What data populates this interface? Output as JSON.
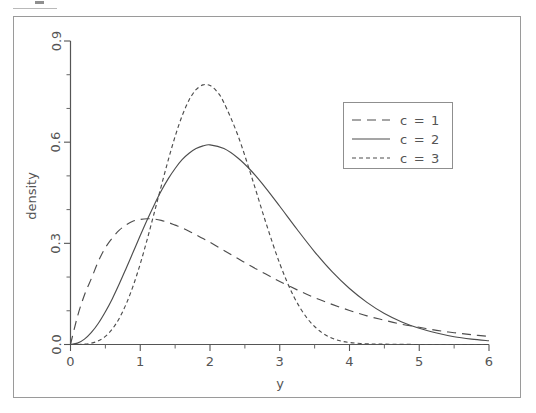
{
  "figure": {
    "frame": {
      "border_color": "#9a9a9a",
      "background": "#ffffff"
    },
    "top_artifact": {
      "visible": true
    }
  },
  "chart_data": {
    "type": "line",
    "title": "",
    "xlabel": "y",
    "ylabel": "density",
    "xlim": [
      0,
      6
    ],
    "ylim": [
      0,
      0.9
    ],
    "grid": false,
    "legend_position": "upper right",
    "x_ticks": [
      "0",
      "1",
      "2",
      "3",
      "4",
      "5",
      "6"
    ],
    "x_tick_values": [
      0,
      1,
      2,
      3,
      4,
      5,
      6
    ],
    "x_minor_tick_values": [
      0.5,
      1.5,
      2.5,
      3.5,
      4.5,
      5.5
    ],
    "y_ticks": [
      "0.0",
      "0.3",
      "0.6",
      "0.9"
    ],
    "y_tick_values": [
      0.0,
      0.3,
      0.6,
      0.9
    ],
    "y_minor_tick_values": [
      0.1,
      0.2,
      0.4,
      0.5,
      0.7,
      0.8
    ],
    "line_color": "#4d4d4d",
    "series": [
      {
        "name": "c = 1",
        "dash": "long-dash",
        "dasharray": "9 6",
        "x": [
          0.0,
          0.1,
          0.2,
          0.3,
          0.4,
          0.5,
          0.6,
          0.7,
          0.8,
          0.9,
          1.0,
          1.1,
          1.2,
          1.3,
          1.4,
          1.5,
          1.6,
          1.7,
          1.8,
          1.9,
          2.0,
          2.2,
          2.4,
          2.6,
          2.8,
          3.0,
          3.25,
          3.5,
          3.75,
          4.0,
          4.25,
          4.5,
          4.75,
          5.0,
          5.25,
          5.5,
          5.75,
          6.0
        ],
        "values": [
          0.0,
          0.083,
          0.147,
          0.196,
          0.247,
          0.287,
          0.316,
          0.339,
          0.355,
          0.366,
          0.371,
          0.373,
          0.372,
          0.368,
          0.362,
          0.354,
          0.346,
          0.336,
          0.325,
          0.314,
          0.303,
          0.279,
          0.255,
          0.231,
          0.209,
          0.187,
          0.162,
          0.139,
          0.119,
          0.101,
          0.085,
          0.072,
          0.06,
          0.051,
          0.042,
          0.035,
          0.029,
          0.024
        ]
      },
      {
        "name": "c = 2",
        "dash": "solid",
        "dasharray": "",
        "x": [
          0.0,
          0.1,
          0.2,
          0.3,
          0.4,
          0.5,
          0.6,
          0.7,
          0.8,
          0.9,
          1.0,
          1.1,
          1.2,
          1.3,
          1.4,
          1.5,
          1.6,
          1.7,
          1.8,
          1.9,
          2.0,
          2.2,
          2.4,
          2.6,
          2.8,
          3.0,
          3.25,
          3.5,
          3.75,
          4.0,
          4.25,
          4.5,
          4.75,
          5.0,
          5.25,
          5.5,
          5.75,
          6.0
        ],
        "values": [
          0.0,
          0.004,
          0.016,
          0.036,
          0.063,
          0.097,
          0.136,
          0.18,
          0.227,
          0.275,
          0.323,
          0.37,
          0.414,
          0.455,
          0.491,
          0.522,
          0.548,
          0.567,
          0.581,
          0.589,
          0.592,
          0.581,
          0.553,
          0.513,
          0.464,
          0.41,
          0.341,
          0.275,
          0.216,
          0.166,
          0.125,
          0.092,
          0.067,
          0.048,
          0.034,
          0.023,
          0.016,
          0.011
        ]
      },
      {
        "name": "c = 3",
        "dash": "short-dash",
        "dasharray": "4 3",
        "x": [
          0.0,
          0.1,
          0.2,
          0.3,
          0.4,
          0.5,
          0.6,
          0.7,
          0.8,
          0.9,
          1.0,
          1.1,
          1.2,
          1.3,
          1.4,
          1.5,
          1.6,
          1.7,
          1.75,
          1.8,
          1.9,
          2.0,
          2.1,
          2.2,
          2.4,
          2.6,
          2.8,
          3.0,
          3.2,
          3.4,
          3.6,
          3.8,
          4.0,
          4.25,
          4.5,
          5.0,
          5.5,
          6.0
        ],
        "values": [
          0.0,
          0.0,
          0.001,
          0.004,
          0.011,
          0.024,
          0.046,
          0.078,
          0.121,
          0.175,
          0.239,
          0.312,
          0.39,
          0.469,
          0.546,
          0.617,
          0.678,
          0.725,
          0.742,
          0.756,
          0.77,
          0.768,
          0.75,
          0.717,
          0.62,
          0.495,
          0.362,
          0.24,
          0.143,
          0.076,
          0.036,
          0.015,
          0.006,
          0.002,
          0.001,
          0.0,
          0.0,
          0.0
        ]
      }
    ]
  },
  "legend": {
    "entries": [
      {
        "label": "c = 1",
        "dasharray": "9 6"
      },
      {
        "label": "c = 2",
        "dasharray": ""
      },
      {
        "label": "c = 3",
        "dasharray": "4 3"
      }
    ]
  }
}
